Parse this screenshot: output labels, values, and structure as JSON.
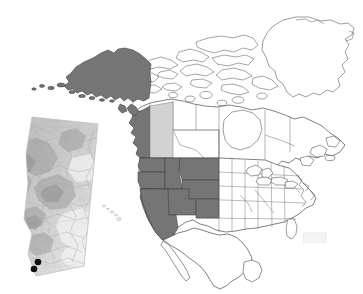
{
  "figure": {
    "name": "north-america-study-area-map",
    "type": "map",
    "projection": "lambert-conformal-conic",
    "background_color": "#ffffff",
    "width": 363,
    "height": 294
  },
  "legend_colors": {
    "highlight_dark": "#757575",
    "highlight_light": "#d2d2d2",
    "unfilled": "#ffffff",
    "border_line": "#4a4a4a",
    "coastline": "#555555",
    "marker": "#101010"
  },
  "basemap": {
    "title": "North America",
    "countries": [
      "Canada",
      "United States",
      "Mexico",
      "Greenland"
    ],
    "water_label": "",
    "stroke_width_country": 0.7,
    "stroke_width_subdivision": 0.5
  },
  "highlighted_regions": {
    "dark_fill": [
      {
        "name": "Alaska",
        "country": "United States",
        "shade": "dark"
      },
      {
        "name": "British Columbia",
        "country": "Canada",
        "shade": "dark"
      },
      {
        "name": "Washington",
        "country": "United States",
        "shade": "dark"
      },
      {
        "name": "Oregon",
        "country": "United States",
        "shade": "dark"
      },
      {
        "name": "California",
        "country": "United States",
        "shade": "dark"
      },
      {
        "name": "Idaho",
        "country": "United States",
        "shade": "dark"
      },
      {
        "name": "Nevada",
        "country": "United States",
        "shade": "dark"
      },
      {
        "name": "Montana",
        "country": "United States",
        "shade": "dark"
      },
      {
        "name": "Wyoming",
        "country": "United States",
        "shade": "dark"
      },
      {
        "name": "Utah",
        "country": "United States",
        "shade": "dark"
      },
      {
        "name": "Colorado",
        "country": "United States",
        "shade": "dark"
      }
    ],
    "light_fill": [
      {
        "name": "Alberta",
        "country": "Canada",
        "shade": "light"
      }
    ]
  },
  "inset": {
    "name": "alberta-terrain-inset",
    "region": "Alberta",
    "country": "Canada",
    "surface": "terrain-elevation-shading",
    "border_visible": false,
    "study_sites": [
      {
        "label": "",
        "x_pct": 29,
        "y_pct": 91
      },
      {
        "label": "",
        "x_pct": 24,
        "y_pct": 87
      }
    ],
    "site_count": 2,
    "marker_shape": "filled-circle",
    "marker_color": "#101010"
  },
  "annotations": {
    "watermark_text": "",
    "scale_bar": "",
    "north_arrow": "",
    "caption": ""
  }
}
